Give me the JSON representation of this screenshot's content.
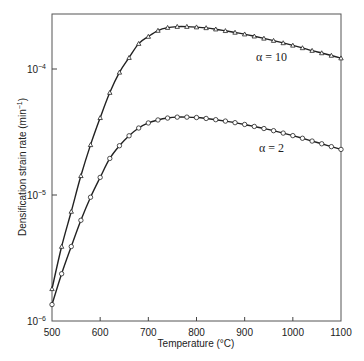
{
  "chart_data": {
    "type": "line",
    "title": "",
    "xlabel": "Temperature (°C)",
    "ylabel": "Densification strain rate (min⁻¹)",
    "xlim": [
      500,
      1100
    ],
    "ylim": [
      1e-06,
      0.000275
    ],
    "yscale": "log",
    "grid": false,
    "legend": "inline labels",
    "x_ticks": [
      500,
      600,
      700,
      800,
      900,
      1000,
      1100
    ],
    "x_tick_labels": [
      "500",
      "600",
      "700",
      "800",
      "900",
      "1000",
      "1100"
    ],
    "y_ticks": [
      1e-06,
      1e-05,
      0.0001
    ],
    "y_tick_labels": [
      "10⁻⁶",
      "10⁻⁵",
      "10⁻⁴"
    ],
    "x": [
      500,
      520,
      540,
      560,
      580,
      600,
      620,
      640,
      660,
      680,
      700,
      720,
      740,
      760,
      780,
      800,
      820,
      840,
      860,
      880,
      900,
      920,
      940,
      960,
      980,
      1000,
      1020,
      1040,
      1060,
      1080,
      1100
    ],
    "series": [
      {
        "name": "α = 10",
        "marker": "triangle",
        "values": [
          1.8e-06,
          3.9e-06,
          7.4e-06,
          1.42e-05,
          2.5e-05,
          4.1e-05,
          6.5e-05,
          9.4e-05,
          0.000123,
          0.000159,
          0.000181,
          0.000202,
          0.000213,
          0.000217,
          0.000217,
          0.000215,
          0.000212,
          0.000207,
          0.000201,
          0.000195,
          0.000189,
          0.000182,
          0.000175,
          0.000168,
          0.000161,
          0.000154,
          0.000147,
          0.00014,
          0.000134,
          0.000128,
          0.000122
        ]
      },
      {
        "name": "α = 2",
        "marker": "circle",
        "values": [
          1.35e-06,
          2.37e-06,
          3.9e-06,
          6.3e-06,
          9.6e-06,
          1.38e-05,
          1.95e-05,
          2.46e-05,
          2.95e-05,
          3.4e-05,
          3.73e-05,
          3.94e-05,
          4.08e-05,
          4.15e-05,
          4.15e-05,
          4.12e-05,
          4.05e-05,
          3.96e-05,
          3.86e-05,
          3.75e-05,
          3.63e-05,
          3.5e-05,
          3.37e-05,
          3.24e-05,
          3.1e-05,
          2.96e-05,
          2.82e-05,
          2.68e-05,
          2.55e-05,
          2.42e-05,
          2.3e-05
        ]
      }
    ],
    "annotations": [
      {
        "text": "α = 10",
        "x": 905,
        "y": 0.00016
      },
      {
        "text": "α = 2",
        "x": 905,
        "y": 2.9e-05
      }
    ]
  },
  "labels": {
    "xlabel": "Temperature (°C)",
    "ylabel_main": "Densification strain rate (min",
    "ylabel_sup": "−1",
    "ylabel_end": ")",
    "alpha10": "α = 10",
    "alpha2": "α = 2"
  }
}
